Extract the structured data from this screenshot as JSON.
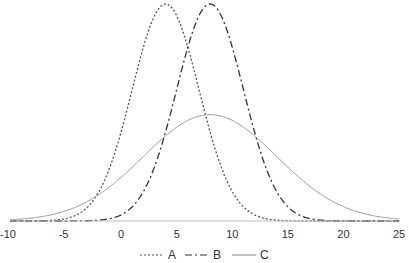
{
  "chart_data": {
    "type": "line",
    "title": "",
    "xlabel": "",
    "ylabel": "",
    "xlim": [
      -10,
      25
    ],
    "xticks": [
      -10,
      -5,
      0,
      5,
      10,
      15,
      20,
      25
    ],
    "grid": false,
    "legend_position": "bottom",
    "series": [
      {
        "name": "A",
        "style": "dotted",
        "color": "#555555",
        "distribution": "normal",
        "mean": 4,
        "sd": 3,
        "peak": 1.0
      },
      {
        "name": "B",
        "style": "dash-dot",
        "color": "#333333",
        "distribution": "normal",
        "mean": 8,
        "sd": 3,
        "peak": 1.0
      },
      {
        "name": "C",
        "style": "solid",
        "color": "#999999",
        "distribution": "normal",
        "mean": 8,
        "sd": 6,
        "peak": 0.49
      }
    ]
  },
  "legend": {
    "items": [
      "A",
      "B",
      "C"
    ]
  }
}
